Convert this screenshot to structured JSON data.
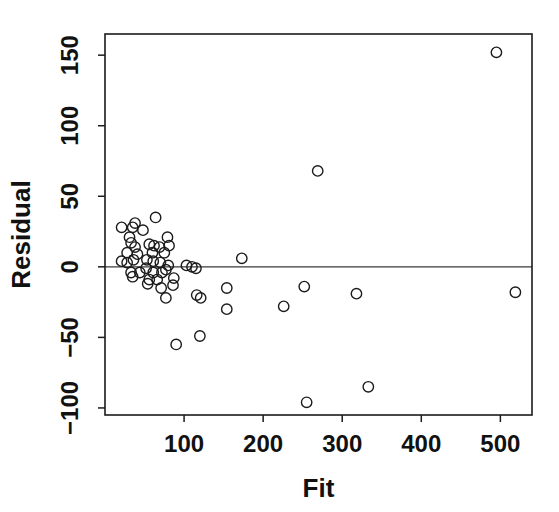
{
  "page": {
    "background": "#ffffff"
  },
  "chart_data": {
    "type": "scatter",
    "title": "",
    "xlabel": "Fit",
    "ylabel": "Residual",
    "xlim": [
      0,
      540
    ],
    "ylim": [
      -105,
      165
    ],
    "x_tick_values": [
      100,
      200,
      300,
      400,
      500
    ],
    "x_tick_labels": [
      "100",
      "200",
      "300",
      "400",
      "500"
    ],
    "y_tick_values": [
      -100,
      -50,
      0,
      50,
      100,
      150
    ],
    "y_tick_labels": [
      "−100",
      "−50",
      "0",
      "50",
      "100",
      "150"
    ],
    "grid": false,
    "legend": "none",
    "reference_line": {
      "axis": "y",
      "value": 0,
      "color": "#3a3a3a"
    },
    "marker": {
      "shape": "open-circle",
      "radius": 5.2,
      "stroke_color": "#1b1b1b",
      "fill": "none"
    },
    "axis_color": "#1b1b1b",
    "text_color": "#111111",
    "points": [
      [
        21,
        28
      ],
      [
        35,
        28
      ],
      [
        38,
        31
      ],
      [
        48,
        26
      ],
      [
        64,
        35
      ],
      [
        31,
        21
      ],
      [
        33,
        17
      ],
      [
        79,
        21
      ],
      [
        81,
        15
      ],
      [
        38,
        14
      ],
      [
        28,
        10
      ],
      [
        41,
        9
      ],
      [
        56,
        16
      ],
      [
        62,
        15
      ],
      [
        69,
        14
      ],
      [
        60,
        10
      ],
      [
        75,
        10
      ],
      [
        21,
        4
      ],
      [
        28,
        3
      ],
      [
        36,
        5
      ],
      [
        53,
        5
      ],
      [
        61,
        4
      ],
      [
        70,
        3
      ],
      [
        80,
        1
      ],
      [
        52,
        -1
      ],
      [
        33,
        -4
      ],
      [
        44,
        -4
      ],
      [
        61,
        -4
      ],
      [
        72,
        -4
      ],
      [
        77,
        -2
      ],
      [
        103,
        1
      ],
      [
        110,
        0
      ],
      [
        115,
        -1
      ],
      [
        35,
        -7
      ],
      [
        54,
        -12
      ],
      [
        56,
        -9
      ],
      [
        66,
        -9
      ],
      [
        71,
        -15
      ],
      [
        87,
        -8
      ],
      [
        86,
        -13
      ],
      [
        77,
        -22
      ],
      [
        116,
        -20
      ],
      [
        121,
        -22
      ],
      [
        120,
        -49
      ],
      [
        90,
        -55
      ],
      [
        154,
        -15
      ],
      [
        154,
        -30
      ],
      [
        173,
        6
      ],
      [
        226,
        -28
      ],
      [
        252,
        -14
      ],
      [
        269,
        68
      ],
      [
        318,
        -19
      ],
      [
        255,
        -96
      ],
      [
        333,
        -85
      ],
      [
        495,
        152
      ],
      [
        519,
        -18
      ]
    ]
  }
}
